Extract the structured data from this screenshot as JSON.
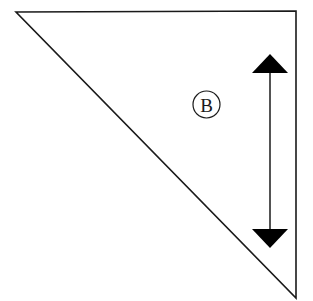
{
  "diagram": {
    "background": "#ffffff",
    "stroke_color": "#1a1a1a",
    "triangle": {
      "vertices": [
        [
          16,
          12
        ],
        [
          296,
          11
        ],
        [
          296,
          298
        ]
      ],
      "stroke_width": 1.6
    },
    "arrow": {
      "x": 270,
      "top_apex_y": 54,
      "top_base_y": 73,
      "bottom_base_y": 229,
      "bottom_apex_y": 248,
      "half_width": 18,
      "direction": "double-vertical"
    },
    "label": {
      "text": "B",
      "cx": 206.5,
      "cy": 104.5,
      "r": 13.5,
      "style": "circled-letter"
    }
  }
}
